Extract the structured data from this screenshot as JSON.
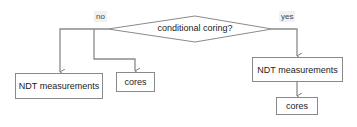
{
  "diagram": {
    "decision": {
      "label": "conditional coring?"
    },
    "branches": {
      "no": {
        "label": "no"
      },
      "yes": {
        "label": "yes"
      }
    },
    "nodes": {
      "no_ndt": {
        "label": "NDT measurements"
      },
      "no_cores": {
        "label": "cores"
      },
      "yes_ndt": {
        "label": "NDT measurements"
      },
      "yes_cores": {
        "label": "cores"
      }
    },
    "colors": {
      "line": "#8a8a8a",
      "arrow": "#7f7f7f",
      "border": "#8a8a8a"
    }
  }
}
